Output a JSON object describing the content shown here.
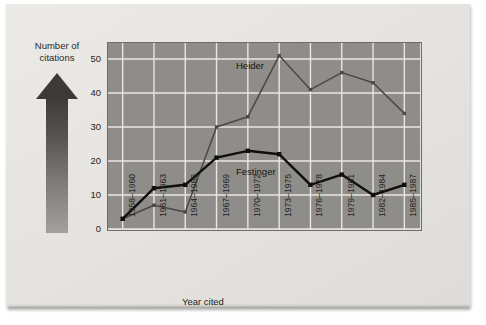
{
  "figure": {
    "y_axis_label": "Number of citations",
    "y_axis_label_line1": "Number of",
    "y_axis_label_line2": "citations",
    "x_axis_label": "Year cited",
    "arrow_icon": "up-arrow-icon"
  },
  "chart_data": {
    "type": "line",
    "title": "",
    "xlabel": "Year cited",
    "ylabel": "Number of citations",
    "categories": [
      "1958–1960",
      "1961–1963",
      "1964–1966",
      "1967–1969",
      "1970–1972",
      "1973–1975",
      "1976–1978",
      "1979–1981",
      "1982–1984",
      "1985–1987"
    ],
    "series": [
      {
        "name": "Heider",
        "color": "#4a4844",
        "values": [
          3,
          7,
          5,
          30,
          33,
          51,
          41,
          46,
          43,
          34
        ]
      },
      {
        "name": "Festinger",
        "color": "#100f0c",
        "values": [
          3,
          12,
          13,
          21,
          23,
          22,
          13,
          16,
          10,
          13
        ]
      }
    ],
    "ylim": [
      0,
      55
    ],
    "yticks": [
      0,
      10,
      20,
      30,
      40,
      50
    ],
    "ytick_labels": [
      "0",
      "10",
      "20",
      "30",
      "40",
      "50"
    ],
    "grid": true,
    "grid_color": "#e9e7e3",
    "plot_background": "#8f8d89",
    "legend": "inline-labels",
    "annotations": [
      {
        "text": "Heider",
        "series": "Heider"
      },
      {
        "text": "Festinger",
        "series": "Festinger"
      }
    ]
  }
}
